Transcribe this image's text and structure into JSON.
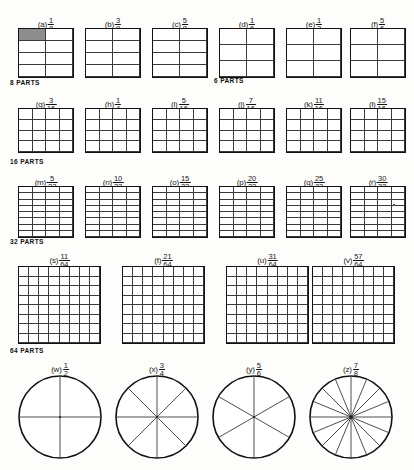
{
  "figure": {
    "background_color": "#fdfdfb",
    "ink_color": "#111111",
    "shade_color": "#8d8d8d"
  },
  "section_labels": [
    {
      "id": "parts-8",
      "text": "8 PARTS"
    },
    {
      "id": "parts-6",
      "text": "6 PARTS"
    },
    {
      "id": "parts-16",
      "text": "16 PARTS"
    },
    {
      "id": "parts-32",
      "text": "32 PARTS"
    },
    {
      "id": "parts-64",
      "text": "64 PARTS"
    }
  ],
  "rows": [
    {
      "id": "row-8-and-6-parts",
      "items": [
        {
          "key": "a",
          "label": "(a)",
          "numerator": "1",
          "denominator": "8",
          "cols": 2,
          "rows": 4,
          "total": 8,
          "shaded": 1
        },
        {
          "key": "b",
          "label": "(b)",
          "numerator": "3",
          "denominator": "8",
          "cols": 2,
          "rows": 4,
          "total": 8,
          "shaded": 0
        },
        {
          "key": "c",
          "label": "(c)",
          "numerator": "5",
          "denominator": "8",
          "cols": 2,
          "rows": 4,
          "total": 8,
          "shaded": 0
        },
        {
          "key": "d",
          "label": "(d)",
          "numerator": "1",
          "denominator": "6",
          "cols": 2,
          "rows": 3,
          "total": 6,
          "shaded": 0
        },
        {
          "key": "e",
          "label": "(e)",
          "numerator": "1",
          "denominator": "2",
          "cols": 2,
          "rows": 3,
          "total": 6,
          "shaded": 0
        },
        {
          "key": "f",
          "label": "(f)",
          "numerator": "5",
          "denominator": "6",
          "cols": 2,
          "rows": 3,
          "total": 6,
          "shaded": 0
        }
      ]
    },
    {
      "id": "row-16-parts",
      "items": [
        {
          "key": "g",
          "label": "(g)",
          "numerator": "3",
          "denominator": "16",
          "cols": 4,
          "rows": 4,
          "total": 16,
          "shaded": 0
        },
        {
          "key": "h",
          "label": "(h)",
          "numerator": "1",
          "denominator": "4",
          "cols": 4,
          "rows": 4,
          "total": 16,
          "shaded": 0
        },
        {
          "key": "i",
          "label": "(i)",
          "numerator": "5",
          "denominator": "16",
          "cols": 4,
          "rows": 4,
          "total": 16,
          "shaded": 0
        },
        {
          "key": "j",
          "label": "(j)",
          "numerator": "7",
          "denominator": "16",
          "cols": 4,
          "rows": 4,
          "total": 16,
          "shaded": 0
        },
        {
          "key": "k",
          "label": "(k)",
          "numerator": "11",
          "denominator": "16",
          "cols": 4,
          "rows": 4,
          "total": 16,
          "shaded": 0
        },
        {
          "key": "l",
          "label": "(l)",
          "numerator": "15",
          "denominator": "16",
          "cols": 4,
          "rows": 4,
          "total": 16,
          "shaded": 0
        }
      ]
    },
    {
      "id": "row-32-parts",
      "items": [
        {
          "key": "m",
          "label": "(m)",
          "numerator": "5",
          "denominator": "32",
          "cols": 4,
          "rows": 8,
          "total": 32,
          "shaded": 0
        },
        {
          "key": "n",
          "label": "(n)",
          "numerator": "10",
          "denominator": "32",
          "cols": 4,
          "rows": 8,
          "total": 32,
          "shaded": 0
        },
        {
          "key": "o",
          "label": "(o)",
          "numerator": "15",
          "denominator": "32",
          "cols": 4,
          "rows": 8,
          "total": 32,
          "shaded": 0
        },
        {
          "key": "p",
          "label": "(p)",
          "numerator": "20",
          "denominator": "32",
          "cols": 4,
          "rows": 8,
          "total": 32,
          "shaded": 0
        },
        {
          "key": "q",
          "label": "(q)",
          "numerator": "25",
          "denominator": "32",
          "cols": 4,
          "rows": 8,
          "total": 32,
          "shaded": 0
        },
        {
          "key": "r",
          "label": "(r)",
          "numerator": "30",
          "denominator": "32",
          "cols": 4,
          "rows": 8,
          "total": 32,
          "shaded": 0
        }
      ]
    },
    {
      "id": "row-64-parts",
      "items": [
        {
          "key": "s",
          "label": "(s)",
          "numerator": "11",
          "denominator": "64",
          "cols": 8,
          "rows": 8,
          "total": 64,
          "shaded": 0
        },
        {
          "key": "t",
          "label": "(t)",
          "numerator": "21",
          "denominator": "64",
          "cols": 8,
          "rows": 8,
          "total": 64,
          "shaded": 0
        },
        {
          "key": "u",
          "label": "(u)",
          "numerator": "31",
          "denominator": "64",
          "cols": 8,
          "rows": 8,
          "total": 64,
          "shaded": 0
        },
        {
          "key": "v",
          "label": "(v)",
          "numerator": "57",
          "denominator": "64",
          "cols": 8,
          "rows": 8,
          "total": 64,
          "shaded": 0
        }
      ]
    },
    {
      "id": "row-circles",
      "items": [
        {
          "key": "w",
          "label": "(w)",
          "numerator": "1",
          "denominator": "2",
          "sectors": 4
        },
        {
          "key": "x",
          "label": "(x)",
          "numerator": "3",
          "denominator": "4",
          "sectors": 8
        },
        {
          "key": "y",
          "label": "(y)",
          "numerator": "5",
          "denominator": "6",
          "sectors": 6
        },
        {
          "key": "z",
          "label": "(z)",
          "numerator": "7",
          "denominator": "8",
          "sectors": 16
        }
      ]
    }
  ]
}
